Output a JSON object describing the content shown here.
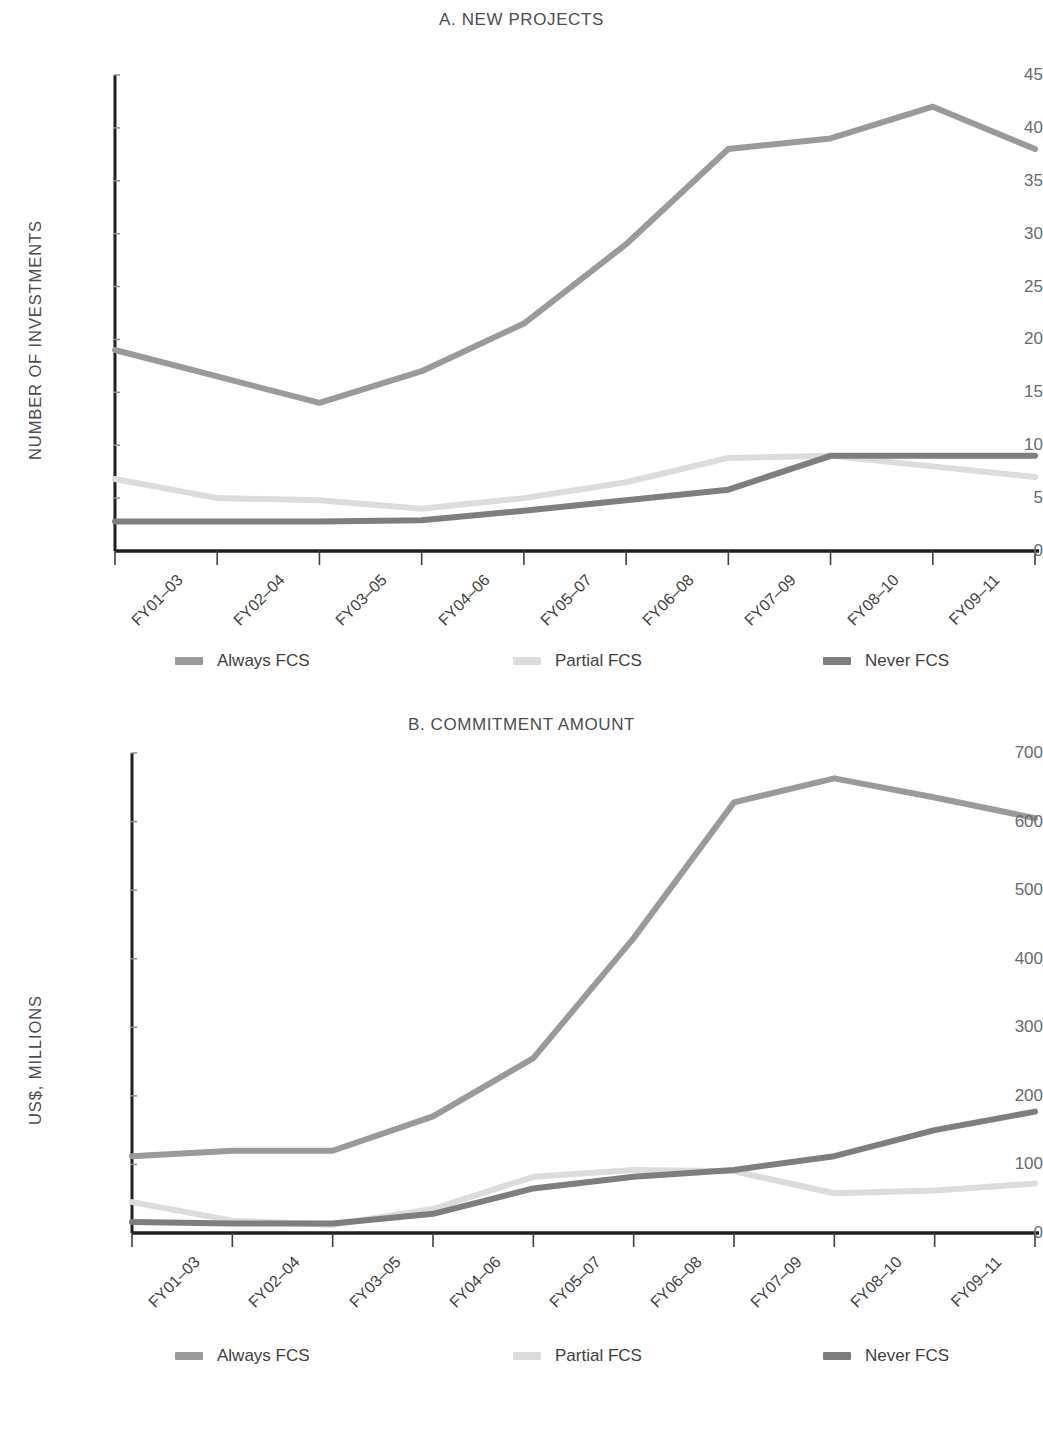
{
  "figure": {
    "series_colors": {
      "always": "#9a9a9c",
      "partial": "#dcdcdc",
      "never": "#7e7e80"
    },
    "axis_color": "#231f20"
  },
  "panel_a": {
    "title": "A. NEW PROJECTS",
    "ylabel": "NUMBER OF INVESTMENTS",
    "legend": [
      {
        "label": "Always FCS",
        "key": "always"
      },
      {
        "label": "Partial FCS",
        "key": "partial"
      },
      {
        "label": "Never FCS",
        "key": "never"
      }
    ]
  },
  "panel_b": {
    "title": "B. COMMITMENT AMOUNT",
    "ylabel": "US$, MILLIONS",
    "legend": [
      {
        "label": "Always FCS",
        "key": "always"
      },
      {
        "label": "Partial FCS",
        "key": "partial"
      },
      {
        "label": "Never FCS",
        "key": "never"
      }
    ]
  },
  "chart_data": [
    {
      "type": "line",
      "title": "A. NEW PROJECTS",
      "xlabel": "",
      "ylabel": "NUMBER OF INVESTMENTS",
      "ylim": [
        0,
        45
      ],
      "yticks": [
        0,
        5,
        10,
        15,
        20,
        25,
        30,
        35,
        40,
        45
      ],
      "grid": false,
      "legend_position": "bottom",
      "categories": [
        "FY01–03",
        "FY02–04",
        "FY03–05",
        "FY04–06",
        "FY05–07",
        "FY06–08",
        "FY07–09",
        "FY08–10",
        "FY09–11",
        "FY10–12"
      ],
      "series": [
        {
          "name": "Always FCS",
          "color": "#9a9a9c",
          "values": [
            19,
            16.5,
            14,
            17,
            21.5,
            29,
            38,
            39,
            42,
            38
          ]
        },
        {
          "name": "Partial FCS",
          "color": "#dcdcdc",
          "values": [
            6.8,
            5,
            4.8,
            4,
            5,
            6.5,
            8.8,
            9,
            8,
            7
          ]
        },
        {
          "name": "Never FCS",
          "color": "#7e7e80",
          "values": [
            2.8,
            2.8,
            2.8,
            2.9,
            3.8,
            4.8,
            5.8,
            9,
            9,
            9
          ]
        }
      ]
    },
    {
      "type": "line",
      "title": "B. COMMITMENT AMOUNT",
      "xlabel": "",
      "ylabel": "US$, MILLIONS",
      "ylim": [
        0,
        700
      ],
      "yticks": [
        0,
        100,
        200,
        300,
        400,
        500,
        600,
        700
      ],
      "grid": false,
      "legend_position": "bottom",
      "categories": [
        "FY01–03",
        "FY02–04",
        "FY03–05",
        "FY04–06",
        "FY05–07",
        "FY06–08",
        "FY07–09",
        "FY08–10",
        "FY09–11",
        "FY10–12"
      ],
      "series": [
        {
          "name": "Always FCS",
          "color": "#9a9a9c",
          "values": [
            112,
            120,
            120,
            170,
            255,
            430,
            628,
            663,
            635,
            605
          ]
        },
        {
          "name": "Partial FCS",
          "color": "#dcdcdc",
          "values": [
            45,
            18,
            12,
            35,
            82,
            92,
            90,
            58,
            62,
            72
          ]
        },
        {
          "name": "Never FCS",
          "color": "#7e7e80",
          "values": [
            16,
            14,
            14,
            28,
            65,
            82,
            92,
            112,
            150,
            177
          ]
        }
      ]
    }
  ]
}
